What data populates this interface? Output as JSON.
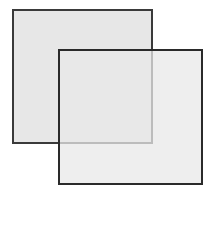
{
  "diagram": {
    "type": "overlapping-squares",
    "shapes": [
      {
        "id": "square-1",
        "x": 12,
        "y": 9,
        "width": 141,
        "height": 135,
        "fill": "#e6e6e6",
        "stroke": "#2a2a2a"
      },
      {
        "id": "square-2",
        "x": 58,
        "y": 49,
        "width": 145,
        "height": 136,
        "fill": "#e8e8e8",
        "stroke": "#2a2a2a"
      }
    ]
  }
}
